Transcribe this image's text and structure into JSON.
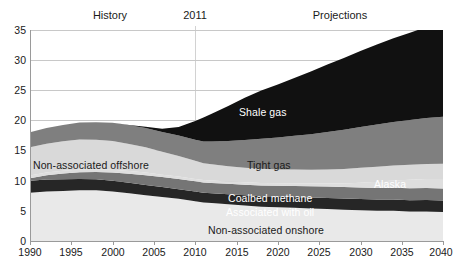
{
  "header": {
    "history_label": "History",
    "year_divider_label": "2011",
    "projections_label": "Projections"
  },
  "chart_data": {
    "type": "area",
    "title": "",
    "subtitle": "",
    "xlabel": "",
    "ylabel": "",
    "xlim": [
      1990,
      2040
    ],
    "ylim": [
      0,
      35
    ],
    "grid": true,
    "stacked": true,
    "legend_position": "inline-annotations",
    "xticks": [
      "1990",
      "1995",
      "2000",
      "2005",
      "2010",
      "2015",
      "2020",
      "2025",
      "2030",
      "2035",
      "2040"
    ],
    "yticks": [
      "0",
      "5",
      "10",
      "15",
      "20",
      "25",
      "30",
      "35"
    ],
    "x": [
      1990,
      1992,
      1994,
      1996,
      1998,
      2000,
      2002,
      2004,
      2006,
      2008,
      2010,
      2011,
      2012,
      2014,
      2016,
      2018,
      2020,
      2022,
      2024,
      2026,
      2028,
      2030,
      2032,
      2034,
      2036,
      2038,
      2040
    ],
    "series": [
      {
        "name": "Non-associated onshore",
        "color": "#e9e9e9",
        "label_color": "#1a1a1a",
        "values": [
          8.0,
          8.2,
          8.3,
          8.4,
          8.4,
          8.2,
          7.9,
          7.6,
          7.3,
          7.0,
          6.6,
          6.4,
          6.3,
          6.1,
          5.9,
          5.7,
          5.6,
          5.5,
          5.4,
          5.3,
          5.2,
          5.1,
          5.0,
          5.0,
          4.9,
          4.9,
          4.8
        ]
      },
      {
        "name": "Associated with oil",
        "color": "#262626",
        "label_color": "#ffffff",
        "values": [
          2.0,
          2.0,
          1.95,
          1.9,
          1.85,
          1.8,
          1.75,
          1.7,
          1.65,
          1.6,
          1.6,
          1.6,
          1.62,
          1.66,
          1.7,
          1.74,
          1.78,
          1.8,
          1.82,
          1.84,
          1.85,
          1.86,
          1.87,
          1.88,
          1.88,
          1.89,
          1.9
        ]
      },
      {
        "name": "Coalbed methane",
        "color": "#757575",
        "label_color": "#ffffff",
        "values": [
          0.4,
          0.7,
          0.95,
          1.1,
          1.2,
          1.35,
          1.5,
          1.6,
          1.65,
          1.7,
          1.7,
          1.7,
          1.7,
          1.72,
          1.75,
          1.78,
          1.8,
          1.82,
          1.85,
          1.88,
          1.9,
          1.92,
          1.94,
          1.96,
          1.98,
          2.0,
          2.0
        ]
      },
      {
        "name": "Alaska",
        "color": "#dedede",
        "label_color": "#ffffff",
        "values": [
          0.45,
          0.45,
          0.45,
          0.45,
          0.45,
          0.45,
          0.45,
          0.45,
          0.4,
          0.4,
          0.4,
          0.4,
          0.4,
          0.4,
          0.4,
          0.4,
          0.4,
          0.42,
          0.45,
          0.5,
          0.6,
          0.8,
          1.0,
          1.2,
          1.4,
          1.5,
          1.6
        ]
      },
      {
        "name": "Non-associated offshore",
        "color": "#d9d9d9",
        "label_color": "#1a1a1a",
        "values": [
          4.7,
          4.8,
          4.9,
          5.0,
          4.9,
          4.8,
          4.5,
          4.2,
          3.8,
          3.4,
          3.0,
          2.8,
          2.7,
          2.5,
          2.4,
          2.35,
          2.3,
          2.3,
          2.3,
          2.35,
          2.4,
          2.45,
          2.5,
          2.5,
          2.5,
          2.5,
          2.5
        ]
      },
      {
        "name": "Tight gas",
        "color": "#7f7f7f",
        "label_color": "#1a1a1a",
        "values": [
          2.5,
          2.6,
          2.7,
          2.8,
          2.9,
          3.0,
          3.1,
          3.2,
          3.3,
          3.4,
          3.5,
          3.6,
          3.8,
          4.2,
          4.6,
          5.0,
          5.3,
          5.6,
          5.9,
          6.2,
          6.5,
          6.8,
          7.0,
          7.2,
          7.4,
          7.6,
          7.8
        ]
      },
      {
        "name": "Shale gas",
        "color": "#111111",
        "label_color": "#ffffff",
        "values": [
          0.0,
          0.0,
          0.0,
          0.0,
          0.0,
          0.0,
          0.05,
          0.2,
          0.5,
          1.4,
          3.1,
          4.0,
          4.6,
          5.8,
          7.0,
          8.0,
          8.8,
          9.6,
          10.4,
          11.2,
          11.9,
          12.6,
          13.3,
          13.9,
          14.5,
          15.1,
          15.6
        ]
      }
    ],
    "totals": [
      18.05,
      18.75,
      19.25,
      19.65,
      19.7,
      19.6,
      19.25,
      18.95,
      18.6,
      18.9,
      19.9,
      20.5,
      21.1,
      22.38,
      23.75,
      24.97,
      25.98,
      27.04,
      28.12,
      29.27,
      30.35,
      31.43,
      32.61,
      33.64,
      34.56,
      35.49,
      36.18
    ]
  },
  "annotations": [
    {
      "text": "Shale gas",
      "style": "white"
    },
    {
      "text": "Tight gas",
      "style": "dark"
    },
    {
      "text": "Non-associated offshore",
      "style": "dark"
    },
    {
      "text": "Alaska",
      "style": "white"
    },
    {
      "text": "Coalbed methane",
      "style": "white"
    },
    {
      "text": "Associated with oil",
      "style": "white"
    },
    {
      "text": "Non-associated onshore",
      "style": "dark"
    }
  ]
}
